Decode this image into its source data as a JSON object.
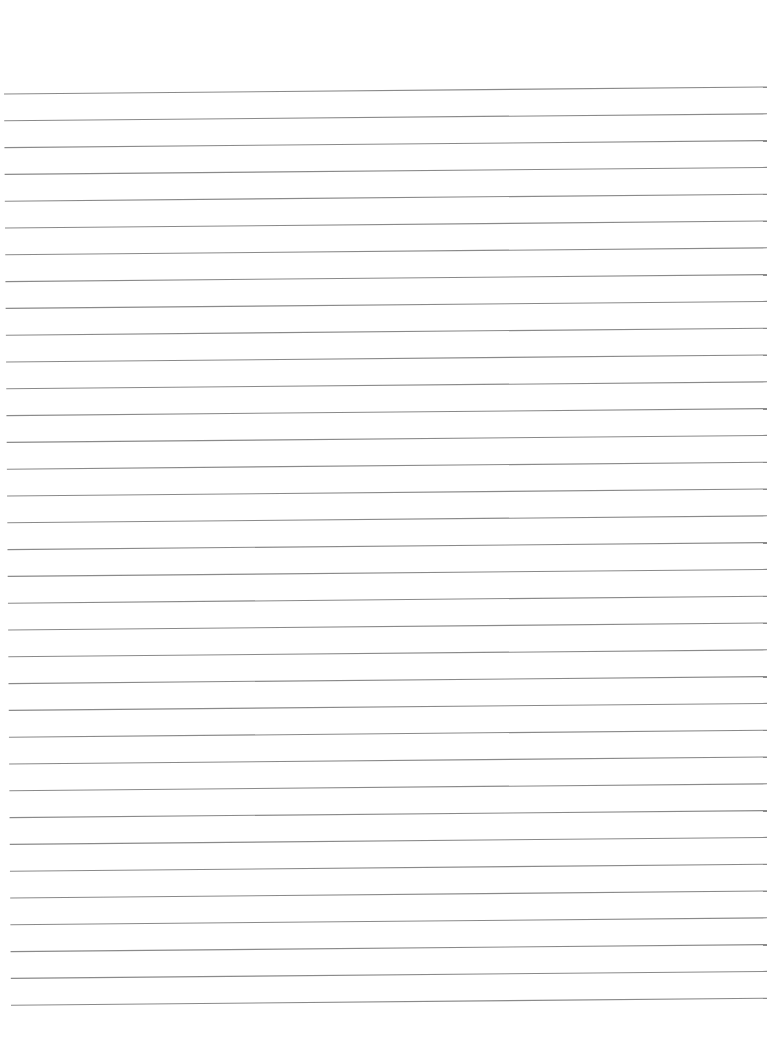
{
  "page": {
    "type": "lined-paper",
    "background_color": "#ffffff",
    "line_color": "#8a8a8a"
  },
  "lines": {
    "count": 35,
    "first_y_left": 94,
    "first_y_right": 87,
    "spacing": 26.8,
    "x_start_top": 4,
    "x_start_bottom": 11,
    "x_end": 767,
    "stroke_width": 1.1
  }
}
